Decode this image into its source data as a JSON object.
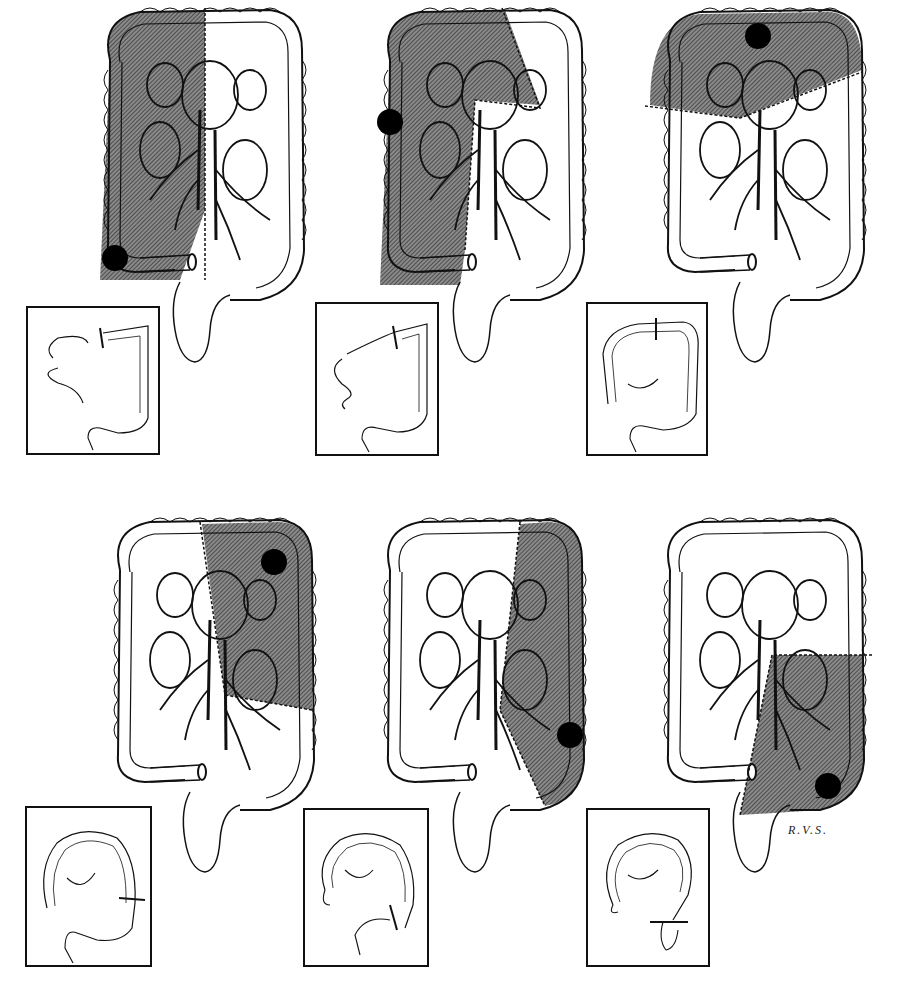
{
  "figure": {
    "signature": "R.V.S.",
    "colors": {
      "ink": "#111111",
      "resected_fill": "#6f6f6f",
      "background": "#ffffff",
      "tumor": "#000000"
    },
    "panels": [
      {
        "id": 1,
        "procedure": "right-hemicolectomy",
        "tumor_site": "cecum",
        "resected_region": "right colon",
        "inset": "ileo-transverse anastomosis"
      },
      {
        "id": 2,
        "procedure": "extended-right-hemicolectomy",
        "tumor_site": "hepatic flexure / ascending colon",
        "resected_region": "right colon and proximal transverse",
        "inset": "ileo-transverse anastomosis"
      },
      {
        "id": 3,
        "procedure": "transverse-colectomy",
        "tumor_site": "transverse colon",
        "resected_region": "transverse colon",
        "inset": "colo-colic anastomosis"
      },
      {
        "id": 4,
        "procedure": "left-hemicolectomy-splenic-flexure",
        "tumor_site": "splenic flexure",
        "resected_region": "distal transverse and upper descending",
        "inset": "transverse-descending anastomosis"
      },
      {
        "id": 5,
        "procedure": "left-hemicolectomy",
        "tumor_site": "descending colon",
        "resected_region": "descending colon",
        "inset": "transverse-sigmoid anastomosis"
      },
      {
        "id": 6,
        "procedure": "sigmoid-colectomy",
        "tumor_site": "sigmoid colon",
        "resected_region": "sigmoid and lower descending",
        "inset": "colo-rectal anastomosis"
      }
    ]
  }
}
